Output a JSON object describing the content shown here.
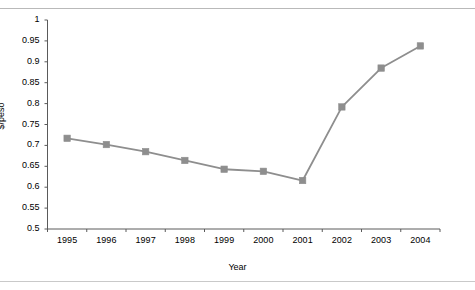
{
  "page": {
    "background_color": "#ffffff",
    "top_ghost_text": "",
    "rule_color": "#b9b9b9"
  },
  "chart_data": {
    "type": "line",
    "title": "",
    "xlabel": "Year",
    "ylabel": "$/peso",
    "categories": [
      "1995",
      "1996",
      "1997",
      "1998",
      "1999",
      "2000",
      "2001",
      "2002",
      "2003",
      "2004"
    ],
    "values": [
      0.717,
      0.702,
      0.685,
      0.664,
      0.643,
      0.638,
      0.616,
      0.792,
      0.885,
      0.938
    ],
    "series": [
      {
        "name": "$/peso",
        "values": [
          0.717,
          0.702,
          0.685,
          0.664,
          0.643,
          0.638,
          0.616,
          0.792,
          0.885,
          0.938
        ],
        "color": "#8e8e8e",
        "marker": "square",
        "marker_color": "#8e8e8e"
      }
    ],
    "ylim": [
      0.5,
      1
    ],
    "yticks": [
      0.5,
      0.55,
      0.6,
      0.65,
      0.7,
      0.75,
      0.8,
      0.85,
      0.9,
      0.95,
      1
    ],
    "ytick_labels": [
      "0.5",
      "0.55",
      "0.6",
      "0.65",
      "0.7",
      "0.75",
      "0.8",
      "0.85",
      "0.9",
      "0.95",
      "1"
    ],
    "xtick_labels": [
      "1995",
      "1996",
      "1997",
      "1998",
      "1999",
      "2000",
      "2001",
      "2002",
      "2003",
      "2004"
    ],
    "grid": false,
    "legend": false,
    "legend_position": "none",
    "axis_color": "#5a5a5a",
    "text_color": "#000000"
  }
}
